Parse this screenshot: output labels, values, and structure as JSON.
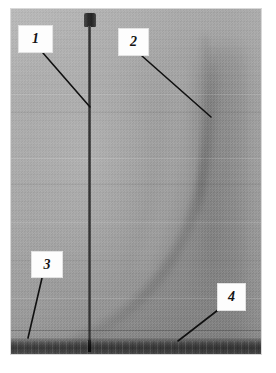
{
  "figure": {
    "kind": "annotated-photograph",
    "photo": {
      "left": 10,
      "top": 8,
      "width": 252,
      "height": 347,
      "background_gray": "#a3a3a3",
      "substrate_gray": "#3a3a3a"
    },
    "features": [
      {
        "name": "nozzle-head",
        "label": "dark nozzle block at top of probe"
      },
      {
        "name": "probe-rod",
        "label": "thin vertical probe rod"
      },
      {
        "name": "plume-column",
        "label": "faint vertical plume column on right"
      },
      {
        "name": "flame-envelope",
        "label": "curved flame envelope sweeping to lower left"
      },
      {
        "name": "substrate-band",
        "label": "dark substrate band at base"
      }
    ]
  },
  "callouts": [
    {
      "id": "1",
      "text": "1",
      "box": {
        "x": 18,
        "y": 25,
        "w": 35,
        "h": 28
      },
      "leader": {
        "x1": 43,
        "y1": 53,
        "x2": 90,
        "y2": 107
      },
      "points_at": "probe-rod"
    },
    {
      "id": "2",
      "text": "2",
      "box": {
        "x": 118,
        "y": 28,
        "w": 31,
        "h": 28
      },
      "leader": {
        "x1": 142,
        "y1": 56,
        "x2": 211,
        "y2": 117
      },
      "points_at": "plume-column"
    },
    {
      "id": "3",
      "text": "3",
      "box": {
        "x": 31,
        "y": 251,
        "w": 32,
        "h": 27
      },
      "leader": {
        "x1": 42,
        "y1": 278,
        "x2": 28,
        "y2": 338
      },
      "points_at": "substrate-band-left"
    },
    {
      "id": "4",
      "text": "4",
      "box": {
        "x": 217,
        "y": 283,
        "w": 29,
        "h": 28
      },
      "leader": {
        "x1": 218,
        "y1": 310,
        "x2": 178,
        "y2": 341
      },
      "points_at": "substrate-band-right"
    }
  ],
  "colors": {
    "page_background": "#ffffff",
    "label_box_fill": "#fdfdfd",
    "label_text": "#141414",
    "leader_line": "#101010"
  }
}
